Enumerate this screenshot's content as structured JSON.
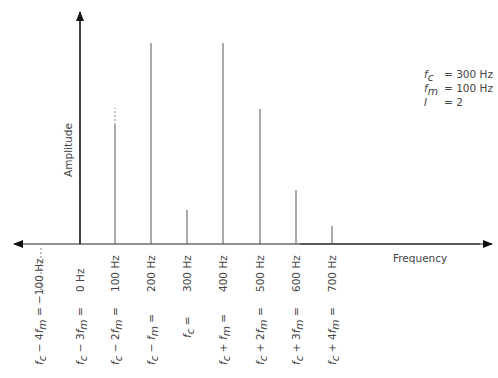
{
  "chart_data": {
    "type": "bar",
    "title": "",
    "xlabel": "Frequency",
    "ylabel": "Amplitude",
    "categories": [
      "-100 Hz",
      "0 Hz",
      "100 Hz",
      "200 Hz",
      "300 Hz",
      "400 Hz",
      "500 Hz",
      "600 Hz",
      "700 Hz"
    ],
    "x": [
      -100,
      0,
      100,
      200,
      300,
      400,
      500,
      600,
      700
    ],
    "values": [
      0.35,
      0,
      0.6,
      0.99,
      0.17,
      0.99,
      0.67,
      0.27,
      0.09
    ],
    "sideband_labels": [
      "fc − 4fm = −100 Hz",
      "fc − 3fm = 0 Hz",
      "fc − 2fm = 100 Hz",
      "fc − fm = 200 Hz",
      "fc = 300 Hz",
      "fc + fm = 400 Hz",
      "fc + 2fm = 500 Hz",
      "fc + 3fm = 600 Hz",
      "fc + 4fm = 700 Hz"
    ],
    "legend": {
      "fc": "300 Hz",
      "fm": "100 Hz",
      "I": "2"
    }
  },
  "axes": {
    "x_label": "Frequency",
    "y_label": "Amplitude"
  },
  "ticks": [
    {
      "x": 80,
      "hz": "0 Hz",
      "formula": [
        "f",
        "c",
        " − 3",
        "f",
        "m",
        " ="
      ]
    },
    {
      "x": 115,
      "hz": "100 Hz",
      "formula": [
        "f",
        "c",
        " − 2",
        "f",
        "m",
        " ="
      ]
    },
    {
      "x": 151,
      "hz": "200 Hz",
      "formula": [
        "f",
        "c",
        " − ",
        "f",
        "m",
        " ="
      ]
    },
    {
      "x": 187,
      "hz": "300 Hz",
      "formula": [
        "f",
        "c",
        " =",
        "",
        "",
        ""
      ]
    },
    {
      "x": 223,
      "hz": "400 Hz",
      "formula": [
        "f",
        "c",
        " + ",
        "f",
        "m",
        " ="
      ]
    },
    {
      "x": 260,
      "hz": "500 Hz",
      "formula": [
        "f",
        "c",
        " + 2",
        "f",
        "m",
        " ="
      ]
    },
    {
      "x": 296,
      "hz": "600 Hz",
      "formula": [
        "f",
        "c",
        " + 3",
        "f",
        "m",
        " ="
      ]
    },
    {
      "x": 332,
      "hz": "700 Hz",
      "formula": [
        "f",
        "c",
        " + 4",
        "f",
        "m",
        " ="
      ]
    }
  ],
  "lines": [
    {
      "x": 115,
      "top": 125,
      "dashed_top": 108
    },
    {
      "x": 151,
      "top": 43
    },
    {
      "x": 187,
      "top": 210
    },
    {
      "x": 223,
      "top": 43
    },
    {
      "x": 260,
      "top": 109
    },
    {
      "x": 296,
      "top": 190
    },
    {
      "x": 332,
      "top": 226
    }
  ],
  "negative_label": {
    "text": "f",
    "sub": "c",
    "rest": " − 4",
    "f2": "f",
    "sub2": "m",
    "tail": " = −100 Hz"
  },
  "legend": [
    {
      "sym": "f",
      "sub": "c",
      "val": "= 300 Hz"
    },
    {
      "sym": "f",
      "sub": "m",
      "val": "= 100 Hz"
    },
    {
      "sym": "I",
      "sub": "",
      "val": "= 2"
    }
  ]
}
